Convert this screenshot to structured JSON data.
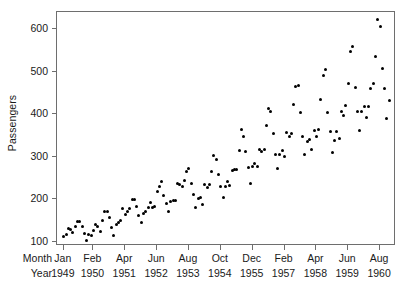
{
  "chart_data": {
    "type": "scatter",
    "title": "",
    "xlabel": "",
    "ylabel": "Passengers",
    "ylim": [
      90,
      640
    ],
    "yticks": [
      100,
      200,
      300,
      400,
      500,
      600
    ],
    "ytick_labels": [
      "100",
      "200",
      "300",
      "400",
      "500",
      "600"
    ],
    "grid": false,
    "legend": null,
    "marker": "filled-circle",
    "marker_color": "#000000",
    "background": "#ffffff",
    "axis_color": "#6e6e6e",
    "x_axis": {
      "row_captions": [
        "Month",
        "Year"
      ],
      "tick_months": [
        "Jan",
        "Feb",
        "Apr",
        "Jun",
        "Aug",
        "Oct",
        "Dec",
        "Feb",
        "Apr",
        "Jun",
        "Aug"
      ],
      "tick_years": [
        "1949",
        "1950",
        "1951",
        "1952",
        "1953",
        "1954",
        "1955",
        "1957",
        "1958",
        "1959",
        "1960"
      ],
      "tick_index": [
        0,
        13,
        27,
        41,
        55,
        69,
        83,
        97,
        111,
        125,
        139
      ],
      "n_observations": 144,
      "xlim_index": [
        -3,
        146
      ]
    },
    "x": [
      "Jan 1949",
      "Feb 1949",
      "Mar 1949",
      "Apr 1949",
      "May 1949",
      "Jun 1949",
      "Jul 1949",
      "Aug 1949",
      "Sep 1949",
      "Oct 1949",
      "Nov 1949",
      "Dec 1949",
      "Jan 1950",
      "Feb 1950",
      "Mar 1950",
      "Apr 1950",
      "May 1950",
      "Jun 1950",
      "Jul 1950",
      "Aug 1950",
      "Sep 1950",
      "Oct 1950",
      "Nov 1950",
      "Dec 1950",
      "Jan 1951",
      "Feb 1951",
      "Mar 1951",
      "Apr 1951",
      "May 1951",
      "Jun 1951",
      "Jul 1951",
      "Aug 1951",
      "Sep 1951",
      "Oct 1951",
      "Nov 1951",
      "Dec 1951",
      "Jan 1952",
      "Feb 1952",
      "Mar 1952",
      "Apr 1952",
      "May 1952",
      "Jun 1952",
      "Jul 1952",
      "Aug 1952",
      "Sep 1952",
      "Oct 1952",
      "Nov 1952",
      "Dec 1952",
      "Jan 1953",
      "Feb 1953",
      "Mar 1953",
      "Apr 1953",
      "May 1953",
      "Jun 1953",
      "Jul 1953",
      "Aug 1953",
      "Sep 1953",
      "Oct 1953",
      "Nov 1953",
      "Dec 1953",
      "Jan 1954",
      "Feb 1954",
      "Mar 1954",
      "Apr 1954",
      "May 1954",
      "Jun 1954",
      "Jul 1954",
      "Aug 1954",
      "Sep 1954",
      "Oct 1954",
      "Nov 1954",
      "Dec 1954",
      "Jan 1955",
      "Feb 1955",
      "Mar 1955",
      "Apr 1955",
      "May 1955",
      "Jun 1955",
      "Jul 1955",
      "Aug 1955",
      "Sep 1955",
      "Oct 1955",
      "Nov 1955",
      "Dec 1955",
      "Jan 1956",
      "Feb 1956",
      "Mar 1956",
      "Apr 1956",
      "May 1956",
      "Jun 1956",
      "Jul 1956",
      "Aug 1956",
      "Sep 1956",
      "Oct 1956",
      "Nov 1956",
      "Dec 1956",
      "Jan 1957",
      "Feb 1957",
      "Mar 1957",
      "Apr 1957",
      "May 1957",
      "Jun 1957",
      "Jul 1957",
      "Aug 1957",
      "Sep 1957",
      "Oct 1957",
      "Nov 1957",
      "Dec 1957",
      "Jan 1958",
      "Feb 1958",
      "Mar 1958",
      "Apr 1958",
      "May 1958",
      "Jun 1958",
      "Jul 1958",
      "Aug 1958",
      "Sep 1958",
      "Oct 1958",
      "Nov 1958",
      "Dec 1958",
      "Jan 1959",
      "Feb 1959",
      "Mar 1959",
      "Apr 1959",
      "May 1959",
      "Jun 1959",
      "Jul 1959",
      "Aug 1959",
      "Sep 1959",
      "Oct 1959",
      "Nov 1959",
      "Dec 1959",
      "Jan 1960",
      "Feb 1960",
      "Mar 1960",
      "Apr 1960",
      "May 1960",
      "Jun 1960",
      "Jul 1960",
      "Aug 1960",
      "Sep 1960",
      "Oct 1960",
      "Nov 1960",
      "Dec 1960"
    ],
    "values": [
      112,
      118,
      132,
      129,
      121,
      135,
      148,
      148,
      136,
      119,
      104,
      118,
      115,
      126,
      141,
      135,
      125,
      149,
      170,
      170,
      158,
      133,
      114,
      140,
      145,
      150,
      178,
      163,
      172,
      178,
      199,
      199,
      184,
      162,
      146,
      166,
      171,
      180,
      193,
      181,
      183,
      218,
      230,
      242,
      209,
      191,
      172,
      194,
      196,
      196,
      236,
      235,
      229,
      243,
      264,
      272,
      237,
      211,
      180,
      201,
      204,
      188,
      235,
      227,
      234,
      264,
      302,
      293,
      259,
      229,
      203,
      229,
      242,
      233,
      267,
      269,
      270,
      315,
      364,
      347,
      312,
      274,
      237,
      278,
      284,
      277,
      317,
      313,
      318,
      374,
      413,
      405,
      355,
      306,
      271,
      306,
      315,
      301,
      356,
      348,
      355,
      422,
      465,
      467,
      404,
      347,
      305,
      336,
      340,
      318,
      362,
      348,
      363,
      435,
      491,
      505,
      404,
      359,
      310,
      337,
      360,
      342,
      406,
      396,
      420,
      472,
      548,
      559,
      463,
      407,
      362,
      405,
      417,
      391,
      419,
      461,
      472,
      535,
      622,
      606,
      508,
      461,
      390,
      432
    ]
  },
  "y_axis_title": "Passengers"
}
